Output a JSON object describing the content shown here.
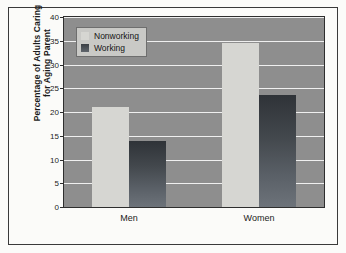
{
  "chart_data": {
    "type": "bar",
    "title": "",
    "subtitle": "",
    "xlabel": "",
    "ylabel": "Percentage of Adults Caring for Aging Parent",
    "ylabel_line1": "Percentage of Adults Caring",
    "ylabel_line2": "for Aging Parent",
    "categories": [
      "Men",
      "Women"
    ],
    "series": [
      {
        "name": "Nonworking",
        "values": [
          21,
          34.5
        ],
        "color": "#d6d6d2"
      },
      {
        "name": "Working",
        "values": [
          14,
          23.5
        ],
        "color": "#43484d"
      }
    ],
    "ylim": [
      0,
      40
    ],
    "ytick_values": [
      40,
      35,
      30,
      25,
      20,
      15,
      10,
      5,
      0
    ],
    "ytick_labels": [
      "40",
      "35",
      "30",
      "25",
      "20",
      "15",
      "10",
      "5",
      "0"
    ],
    "ytick_step": 5,
    "grid": true,
    "grid_color": "#efefef",
    "plot_background": "#8e8e8e",
    "legend_position": "top-left-inside",
    "legend_entries": [
      "Nonworking",
      "Working"
    ]
  },
  "axis": {
    "y_title_line1": "Percentage of Adults Caring",
    "y_title_line2": "for Aging Parent"
  },
  "legend": {
    "items": [
      {
        "label": "Nonworking"
      },
      {
        "label": "Working"
      }
    ]
  },
  "xaxis": {
    "labels": [
      "Men",
      "Women"
    ]
  },
  "yaxis": {
    "labels": [
      "40",
      "35",
      "30",
      "25",
      "20",
      "15",
      "10",
      "5",
      "0"
    ]
  }
}
